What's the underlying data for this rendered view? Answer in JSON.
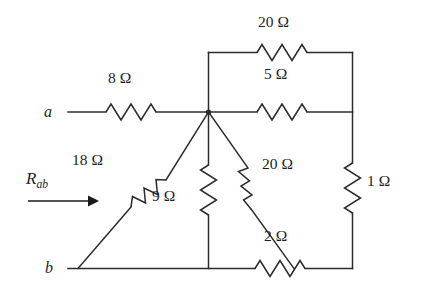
{
  "figure": {
    "type": "circuit-schematic",
    "background_color": "#ffffff",
    "line_color": "#2b2b2b",
    "text_color": "#1d1d1d",
    "width": 423,
    "height": 293
  },
  "terminals": [
    {
      "id": "a",
      "label": "a",
      "x": 50,
      "y": 112
    },
    {
      "id": "b",
      "label": "b",
      "x": 50,
      "y": 268
    }
  ],
  "measurement": {
    "symbol": "R",
    "subscript": "ab",
    "label": "Rab",
    "arrow_direction": "right",
    "arrow_x1": 28,
    "arrow_x2": 96,
    "arrow_y": 201
  },
  "components": [
    {
      "id": "r-8",
      "value": 8,
      "unit": "Ω",
      "label": "8 Ω",
      "orientation": "horizontal",
      "branch": "a-terminal to center node",
      "label_x": 127,
      "label_y": 78
    },
    {
      "id": "r-20-top",
      "value": 20,
      "unit": "Ω",
      "label": "20 Ω",
      "orientation": "horizontal",
      "branch": "top loop: center node column to right rail",
      "label_x": 280,
      "label_y": 22
    },
    {
      "id": "r-5",
      "value": 5,
      "unit": "Ω",
      "label": "5 Ω",
      "orientation": "horizontal",
      "branch": "center node to right rail",
      "label_x": 280,
      "label_y": 74
    },
    {
      "id": "r-18",
      "value": 18,
      "unit": "Ω",
      "label": "18 Ω",
      "orientation": "diagonal",
      "branch": "b-terminal rail up-right to center node",
      "label_x": 96,
      "label_y": 160
    },
    {
      "id": "r-9",
      "value": 9,
      "unit": "Ω",
      "label": "9 Ω",
      "orientation": "vertical",
      "branch": "center node down to bottom rail",
      "label_x": 163,
      "label_y": 196
    },
    {
      "id": "r-20-diag",
      "value": 20,
      "unit": "Ω",
      "label": "20 Ω",
      "orientation": "diagonal",
      "branch": "center node down-right to bottom-right corner",
      "label_x": 278,
      "label_y": 164
    },
    {
      "id": "r-1",
      "value": 1,
      "unit": "Ω",
      "label": "1 Ω",
      "orientation": "vertical",
      "branch": "right rail between 5 Ω node and bottom rail",
      "label_x": 364,
      "label_y": 181
    },
    {
      "id": "r-2",
      "value": 2,
      "unit": "Ω",
      "label": "2 Ω",
      "orientation": "horizontal",
      "branch": "bottom rail between 9 Ω node and bottom-right corner",
      "label_x": 274,
      "label_y": 236
    }
  ]
}
